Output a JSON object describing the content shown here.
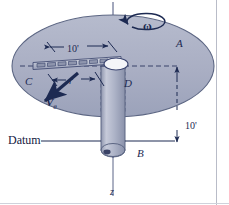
{
  "figure": {
    "type": "engineering-mechanics-diagram",
    "labels": {
      "disk": "A",
      "rod_end": "C",
      "collar": "D",
      "shaft_base": "B",
      "axis": "z",
      "radius": "r",
      "angular_velocity": "ω",
      "velocity": "V",
      "velocity_subscript": "θ",
      "datum": "Datum",
      "dim_radial": "10'",
      "dim_vertical": "10'"
    },
    "colors": {
      "disk_fill": "#a9aec3",
      "disk_edge": "#5f6784",
      "ink": "#1d2a52",
      "shaft_fill": "#b4b9cc",
      "background": "#ffffff",
      "collar_fill": "#f2f3f7"
    },
    "geometry": {
      "disk_center_x": 113,
      "disk_center_y": 66,
      "disk_rx": 101,
      "disk_ry": 51,
      "shaft_top_y": 66,
      "shaft_bottom_y": 158,
      "datum_y": 144
    }
  }
}
